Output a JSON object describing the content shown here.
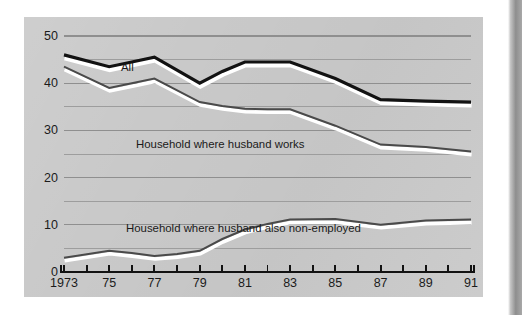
{
  "figure": {
    "panel_bg": "#c9c9c9",
    "page_bg": "#ffffff"
  },
  "chart_data": {
    "type": "line",
    "title": "",
    "subtitle": "",
    "xlabel": "",
    "ylabel": "",
    "grid": true,
    "legend_position": "inline-annotations",
    "xlim": [
      1973,
      1991
    ],
    "ylim": [
      0,
      50
    ],
    "ytick_labels": [
      "0",
      "10",
      "20",
      "30",
      "40",
      "50"
    ],
    "yticks": [
      0,
      10,
      20,
      30,
      40,
      50
    ],
    "y_minor_gridlines": [
      5,
      15,
      25,
      35,
      45
    ],
    "xtick_labels": [
      "1973",
      "",
      "75",
      "",
      "77",
      "",
      "79",
      "",
      "81",
      "",
      "83",
      "",
      "85",
      "",
      "87",
      "",
      "89",
      "",
      "91"
    ],
    "x": [
      1973,
      1974,
      1975,
      1976,
      1977,
      1978,
      1979,
      1980,
      1981,
      1982,
      1983,
      1984,
      1985,
      1986,
      1987,
      1988,
      1989,
      1990,
      1991
    ],
    "x_labeled": [
      {
        "year": 1973,
        "label": "1973"
      },
      {
        "year": 1975,
        "label": "75"
      },
      {
        "year": 1977,
        "label": "77"
      },
      {
        "year": 1979,
        "label": "79"
      },
      {
        "year": 1981,
        "label": "81"
      },
      {
        "year": 1983,
        "label": "83"
      },
      {
        "year": 1985,
        "label": "85"
      },
      {
        "year": 1987,
        "label": "87"
      },
      {
        "year": 1989,
        "label": "89"
      },
      {
        "year": 1991,
        "label": "91"
      }
    ],
    "series": [
      {
        "name": "All",
        "label": "All",
        "color": "#121212",
        "width": 3.2,
        "x": [
          1973,
          1975,
          1976,
          1977,
          1979,
          1980,
          1981,
          1982,
          1983,
          1985,
          1987,
          1989,
          1991
        ],
        "values": [
          46.0,
          43.5,
          44.5,
          45.5,
          40.0,
          42.5,
          44.5,
          44.5,
          44.5,
          41.0,
          36.5,
          36.2,
          36.0
        ]
      },
      {
        "name": "Household where husband works",
        "label": "Household where husband works",
        "color": "#4a4a4a",
        "width": 2.0,
        "x": [
          1973,
          1975,
          1976,
          1977,
          1979,
          1980,
          1981,
          1982,
          1983,
          1985,
          1987,
          1989,
          1991
        ],
        "values": [
          43.5,
          39.0,
          40.0,
          41.0,
          36.0,
          35.2,
          34.6,
          34.5,
          34.5,
          31.0,
          27.0,
          26.5,
          25.5
        ]
      },
      {
        "name": "Household where husband also non-employed",
        "label": "Household where husband also non-employed",
        "color": "#4a4a4a",
        "width": 2.0,
        "x": [
          1973,
          1975,
          1976,
          1977,
          1978,
          1979,
          1980,
          1981,
          1982,
          1983,
          1985,
          1987,
          1989,
          1991
        ],
        "values": [
          3.0,
          4.5,
          4.0,
          3.4,
          3.8,
          4.5,
          7.0,
          9.0,
          10.2,
          11.1,
          11.2,
          10.0,
          10.9,
          11.1
        ]
      }
    ]
  }
}
